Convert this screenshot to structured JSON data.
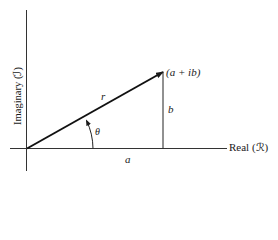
{
  "diagram": {
    "type": "complex-plane-phasor",
    "axes": {
      "x_label": "Real (ℛ)",
      "y_label": "Imaginary (ℐ)"
    },
    "vector": {
      "label": "r",
      "tip_label": "(a + ib)"
    },
    "angle_label": "θ",
    "real_component_label": "a",
    "imaginary_component_label": "b",
    "colors": {
      "line": "#1a1a1a",
      "background": "#ffffff"
    }
  }
}
